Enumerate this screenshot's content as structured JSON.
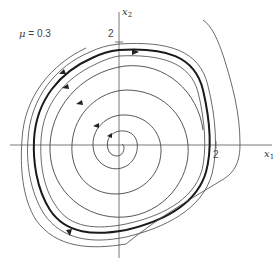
{
  "figure": {
    "parameter_label": "μ = 0.3",
    "parameter_symbol": "μ",
    "parameter_value": "= 0.3",
    "x_axis_label": "x",
    "x_axis_sub": "1",
    "y_axis_label": "x",
    "y_axis_sub": "2",
    "x_tick_label": "2",
    "y_tick_label": "2",
    "colors": {
      "curve": "#444444",
      "limit_cycle": "#1a1a1a",
      "axis": "#555555",
      "background": "#ffffff"
    }
  }
}
